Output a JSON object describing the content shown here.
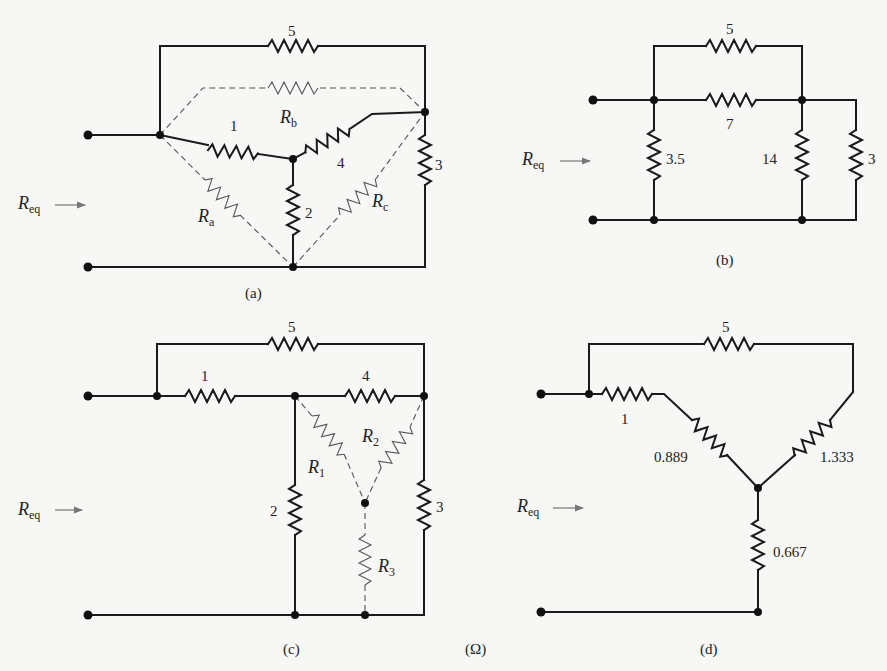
{
  "figure": {
    "unit_label": "(Ω)",
    "req_label": "R",
    "req_sub": "eq",
    "panels": {
      "a": {
        "caption": "(a)",
        "resistors": {
          "top": "5",
          "left_mid": "1",
          "right_mid": "4",
          "center_vertical": "2",
          "right_vertical": "3"
        },
        "delta_labels": {
          "Rb": "R",
          "Rb_sub": "b",
          "Ra": "R",
          "Ra_sub": "a",
          "Rc": "R",
          "Rc_sub": "c"
        }
      },
      "b": {
        "caption": "(b)",
        "resistors": {
          "top": "5",
          "middle": "7",
          "left_vertical": "3.5",
          "center_vertical": "14",
          "right_vertical": "3"
        }
      },
      "c": {
        "caption": "(c)",
        "resistors": {
          "top": "5",
          "left_series": "1",
          "right_series": "4",
          "left_vertical": "2",
          "right_vertical": "3"
        },
        "wye_labels": {
          "R1": "R",
          "R1_sub": "1",
          "R2": "R",
          "R2_sub": "2",
          "R3": "R",
          "R3_sub": "3"
        }
      },
      "d": {
        "caption": "(d)",
        "resistors": {
          "top": "5",
          "left_series": "1",
          "left_diag": "0.889",
          "right_diag": "1.333",
          "bottom_vertical": "0.667"
        }
      }
    }
  }
}
